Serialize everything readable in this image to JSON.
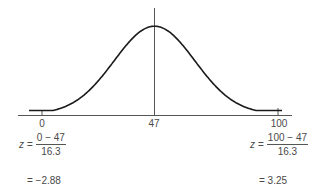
{
  "chart_data": {
    "type": "line",
    "title": "",
    "mean": 47,
    "std_dev": 16.3,
    "x_ticks": [
      0,
      47,
      100
    ],
    "tick_labels": [
      "0",
      "47",
      "100"
    ],
    "mean_line": true,
    "grid": false,
    "xlabel": "",
    "ylabel": "",
    "annotations": [
      {
        "x": 0,
        "z_formula": "z = (0 − 47) / 16.3",
        "z_value": -2.88
      },
      {
        "x": 100,
        "z_formula": "z = (100 − 47) / 16.3",
        "z_value": 3.25
      }
    ]
  },
  "axis": {
    "ticks": [
      {
        "label": "0",
        "px": 42
      },
      {
        "label": "47",
        "px": 154
      },
      {
        "label": "100",
        "px": 278
      }
    ]
  },
  "left_calc": {
    "var": "z",
    "eq": "=",
    "numerator": "0 − 47",
    "denominator": "16.3",
    "result": "= −2.88"
  },
  "right_calc": {
    "var": "z",
    "eq": "=",
    "numerator": "100 − 47",
    "denominator": "16.3",
    "result": "= 3.25"
  },
  "colors": {
    "curve": "#1a1a1a",
    "axis": "#555555",
    "text": "#4a4a4a"
  }
}
